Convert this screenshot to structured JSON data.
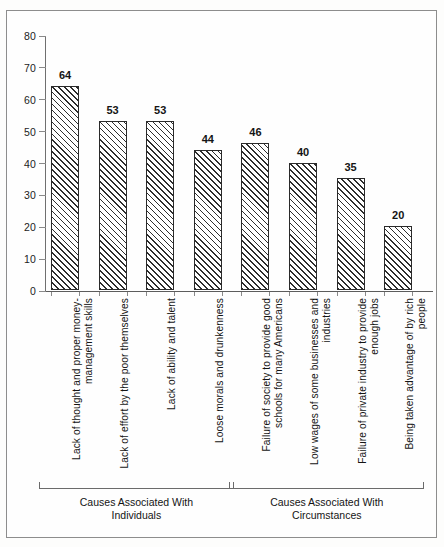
{
  "chart_data": {
    "type": "bar",
    "title": "",
    "subtitle": "",
    "xlabel": "",
    "ylabel": "",
    "ylim": [
      0,
      80
    ],
    "ytick_labels": [
      "80",
      "70",
      "60",
      "50",
      "40",
      "30",
      "20",
      "10",
      "0"
    ],
    "yticks": [
      80,
      70,
      60,
      50,
      40,
      30,
      20,
      10,
      0
    ],
    "grid": false,
    "legend": "none",
    "categories": [
      "Lack of thought and proper money-\nmanagement skills",
      "Lack of effort by the poor themselves",
      "Lack of ability and talent",
      "Loose morals and drunkenness",
      "Failure of society to provide good\nschools for many Americans",
      "Low wages of some businesses and\nindustries",
      "Failure of private industry to provide\nenough jobs",
      "Being taken advantage of by rich\npeople"
    ],
    "values": [
      64,
      53,
      53,
      44,
      46,
      40,
      35,
      20
    ],
    "value_labels": [
      "64",
      "53",
      "53",
      "44",
      "46",
      "40",
      "35",
      "20"
    ],
    "groups": [
      {
        "caption": "Causes Associated With\nIndividuals",
        "category_indices": [
          0,
          1,
          2,
          3
        ]
      },
      {
        "caption": "Causes Associated With\nCircumstances",
        "category_indices": [
          4,
          5,
          6,
          7
        ]
      }
    ],
    "bar_fill": "diagonal-hatch",
    "bar_edge_color": "#2a2a2a",
    "background_color": "#ffffff"
  }
}
